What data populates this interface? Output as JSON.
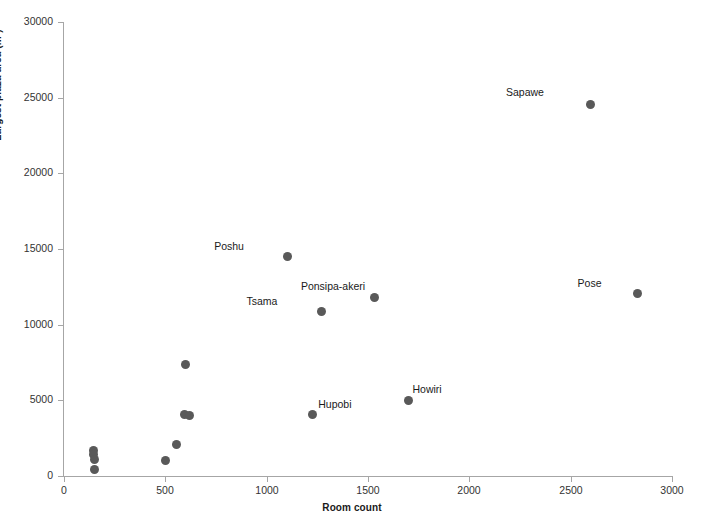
{
  "chart_data": {
    "type": "scatter",
    "title": "",
    "xlabel": "Room count",
    "ylabel": "Largest plaza area (m²)",
    "xlim": [
      0,
      3000
    ],
    "ylim": [
      0,
      30000
    ],
    "grid": false,
    "legend": null,
    "marker_color": "#595959",
    "axis_color": "#a6a6a6",
    "xticks": [
      0,
      500,
      1000,
      1500,
      2000,
      2500,
      3000
    ],
    "xtick_labels": [
      "0",
      "500",
      "1000",
      "1500",
      "2000",
      "2500",
      "3000"
    ],
    "yticks": [
      0,
      5000,
      10000,
      15000,
      20000,
      25000,
      30000
    ],
    "ytick_labels": [
      "0",
      "5000",
      "10000",
      "15000",
      "20000",
      "25000",
      "30000"
    ],
    "points": [
      {
        "label": "",
        "x": 145,
        "y": 1700
      },
      {
        "label": "",
        "x": 148,
        "y": 1400
      },
      {
        "label": "",
        "x": 150,
        "y": 1100
      },
      {
        "label": "",
        "x": 152,
        "y": 400
      },
      {
        "label": "",
        "x": 500,
        "y": 1050
      },
      {
        "label": "",
        "x": 555,
        "y": 2100
      },
      {
        "label": "",
        "x": 595,
        "y": 4050
      },
      {
        "label": "",
        "x": 620,
        "y": 4000
      },
      {
        "label": "",
        "x": 600,
        "y": 7350
      },
      {
        "label": "Poshu",
        "x": 1105,
        "y": 14500,
        "label_dx": -44,
        "label_dy": -16
      },
      {
        "label": "Tsama",
        "x": 1270,
        "y": 10850,
        "label_dx": -44,
        "label_dy": -16
      },
      {
        "label": "Ponsipa-akeri",
        "x": 1530,
        "y": 11800,
        "label_dx": -9,
        "label_dy": -16
      },
      {
        "label": "Hupobi",
        "x": 1225,
        "y": 4050,
        "label_dx": 6,
        "label_dy": -16
      },
      {
        "label": "Howiri",
        "x": 1700,
        "y": 5000,
        "label_dx": 4,
        "label_dy": -16
      },
      {
        "label": "Sapawe",
        "x": 2600,
        "y": 24550,
        "label_dx": -47,
        "label_dy": -17
      },
      {
        "label": "Pose",
        "x": 2830,
        "y": 12050,
        "label_dx": -36,
        "label_dy": -16
      }
    ]
  }
}
